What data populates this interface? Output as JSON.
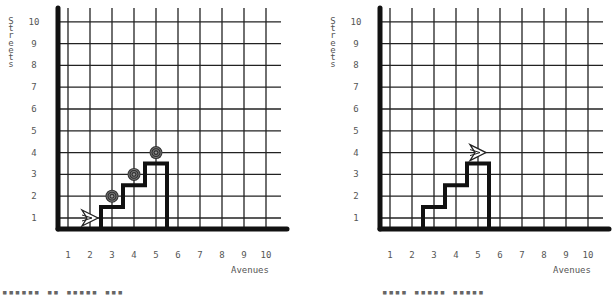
{
  "panels": [
    {
      "id": "left",
      "origin_x": 58,
      "x_axis_label": "Avenues",
      "y_axis_label": "Streets",
      "avenues": [
        "1",
        "2",
        "3",
        "4",
        "5",
        "6",
        "7",
        "8",
        "9",
        "10"
      ],
      "streets": [
        "1",
        "2",
        "3",
        "4",
        "5",
        "6",
        "7",
        "8",
        "9",
        "10"
      ],
      "walls": [
        [
          2.5,
          0.5
        ],
        [
          2.5,
          1.5
        ],
        [
          3.5,
          1.5
        ],
        [
          3.5,
          2.5
        ],
        [
          4.5,
          2.5
        ],
        [
          4.5,
          3.5
        ],
        [
          5.5,
          3.5
        ],
        [
          5.5,
          0.5
        ]
      ],
      "beepers": [
        [
          3,
          2
        ],
        [
          4,
          3
        ],
        [
          5,
          4
        ]
      ],
      "robot": {
        "avenue": 2,
        "street": 1,
        "facing": "east"
      },
      "caption": "▪▪▪▪▪▪ ▪▪ ▪▪▪▪▪ ▪▪▪"
    },
    {
      "id": "right",
      "origin_x": 380,
      "x_axis_label": "Avenues",
      "y_axis_label": "Streets",
      "avenues": [
        "1",
        "2",
        "3",
        "4",
        "5",
        "6",
        "7",
        "8",
        "9",
        "10"
      ],
      "streets": [
        "1",
        "2",
        "3",
        "4",
        "5",
        "6",
        "7",
        "8",
        "9",
        "10"
      ],
      "walls": [
        [
          2.5,
          0.5
        ],
        [
          2.5,
          1.5
        ],
        [
          3.5,
          1.5
        ],
        [
          3.5,
          2.5
        ],
        [
          4.5,
          2.5
        ],
        [
          4.5,
          3.5
        ],
        [
          5.5,
          3.5
        ],
        [
          5.5,
          0.5
        ]
      ],
      "beepers": [],
      "robot": {
        "avenue": 5,
        "street": 4,
        "facing": "east"
      },
      "caption": "▪▪▪▪ ▪▪▪▪▪ ▪▪▪▪▪"
    }
  ],
  "chart_data": [
    {
      "type": "table",
      "title": "Karel world (left)",
      "xlabel": "Avenues",
      "ylabel": "Streets",
      "x_ticks": [
        1,
        2,
        3,
        4,
        5,
        6,
        7,
        8,
        9,
        10
      ],
      "y_ticks": [
        1,
        2,
        3,
        4,
        5,
        6,
        7,
        8,
        9,
        10
      ],
      "beepers": [
        [
          3,
          2
        ],
        [
          4,
          3
        ],
        [
          5,
          4
        ]
      ],
      "robot": {
        "avenue": 2,
        "street": 1,
        "facing": "east"
      },
      "wall_path": [
        [
          2.5,
          0.5
        ],
        [
          2.5,
          1.5
        ],
        [
          3.5,
          1.5
        ],
        [
          3.5,
          2.5
        ],
        [
          4.5,
          2.5
        ],
        [
          4.5,
          3.5
        ],
        [
          5.5,
          3.5
        ],
        [
          5.5,
          0.5
        ]
      ]
    },
    {
      "type": "table",
      "title": "Karel world (right)",
      "xlabel": "Avenues",
      "ylabel": "Streets",
      "x_ticks": [
        1,
        2,
        3,
        4,
        5,
        6,
        7,
        8,
        9,
        10
      ],
      "y_ticks": [
        1,
        2,
        3,
        4,
        5,
        6,
        7,
        8,
        9,
        10
      ],
      "beepers": [],
      "robot": {
        "avenue": 5,
        "street": 4,
        "facing": "east"
      },
      "wall_path": [
        [
          2.5,
          0.5
        ],
        [
          2.5,
          1.5
        ],
        [
          3.5,
          1.5
        ],
        [
          3.5,
          2.5
        ],
        [
          4.5,
          2.5
        ],
        [
          4.5,
          3.5
        ],
        [
          5.5,
          3.5
        ],
        [
          5.5,
          0.5
        ]
      ]
    }
  ]
}
